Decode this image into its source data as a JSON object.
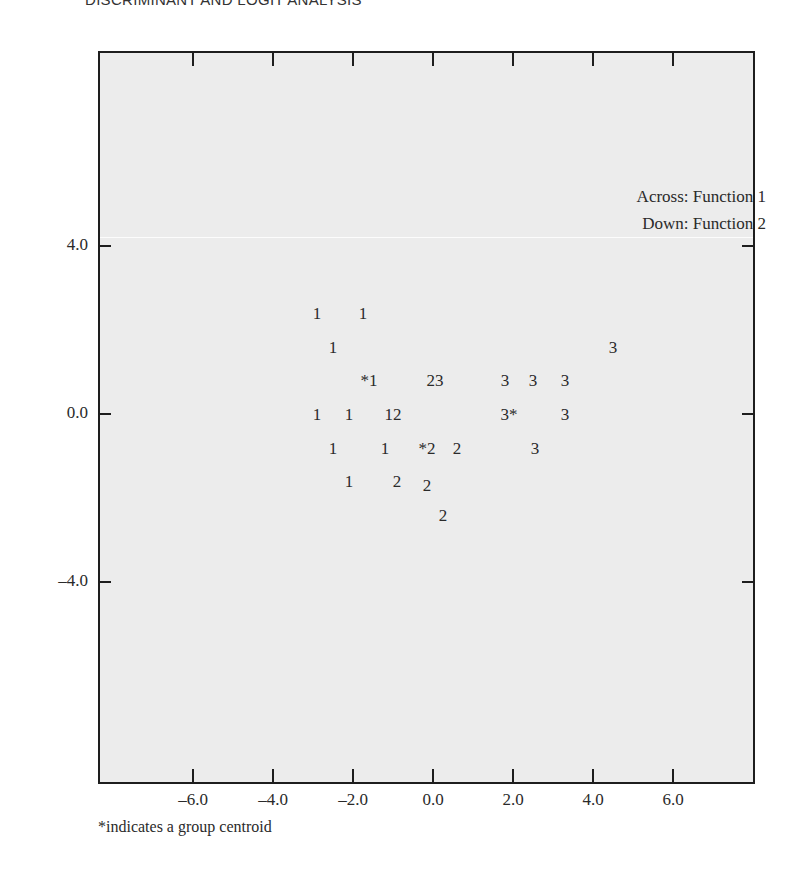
{
  "page": {
    "header": "DISCRIMINANT AND LOGIT ANALYSIS",
    "footnote": "*indicates a group centroid"
  },
  "chart_data": {
    "type": "scatter",
    "title": "",
    "legend": [
      "Across: Function 1",
      "Down: Function 2"
    ],
    "xlabel": "Function 1",
    "ylabel": "Function 2",
    "x_ticks": [
      "-6.0",
      "-4.0",
      "-2.0",
      "0.0",
      "2.0",
      "4.0",
      "6.0"
    ],
    "y_ticks": [
      "4.0",
      "0.0",
      "-4.0"
    ],
    "xlim": [
      -8.0,
      8.0
    ],
    "ylim": [
      -8.6,
      8.8
    ],
    "grid": false,
    "annotation": "*indicates a group centroid",
    "points": [
      {
        "label": "1",
        "x": -2.9,
        "y": 2.4,
        "group": 1
      },
      {
        "label": "1",
        "x": -1.75,
        "y": 2.4,
        "group": 1
      },
      {
        "label": "1",
        "x": -2.5,
        "y": 1.6,
        "group": 1
      },
      {
        "label": "*1",
        "x": -1.6,
        "y": 0.8,
        "group": 1,
        "centroid": true
      },
      {
        "label": "23",
        "x": 0.05,
        "y": 0.8,
        "group": "2,3"
      },
      {
        "label": "1",
        "x": -2.9,
        "y": 0.0,
        "group": 1
      },
      {
        "label": "1",
        "x": -2.1,
        "y": 0.0,
        "group": 1
      },
      {
        "label": "12",
        "x": -1.0,
        "y": 0.0,
        "group": "1,2"
      },
      {
        "label": "1",
        "x": -2.5,
        "y": -0.8,
        "group": 1
      },
      {
        "label": "1",
        "x": -1.2,
        "y": -0.8,
        "group": 1
      },
      {
        "label": "*2",
        "x": -0.15,
        "y": -0.8,
        "group": 2,
        "centroid": true
      },
      {
        "label": "2",
        "x": 0.6,
        "y": -0.8,
        "group": 2
      },
      {
        "label": "1",
        "x": -2.1,
        "y": -1.6,
        "group": 1
      },
      {
        "label": "2",
        "x": -0.9,
        "y": -1.6,
        "group": 2
      },
      {
        "label": "2",
        "x": -0.15,
        "y": -1.7,
        "group": 2
      },
      {
        "label": "2",
        "x": 0.25,
        "y": -2.4,
        "group": 2
      },
      {
        "label": "3",
        "x": 4.5,
        "y": 1.6,
        "group": 3
      },
      {
        "label": "3",
        "x": 1.8,
        "y": 0.8,
        "group": 3
      },
      {
        "label": "3",
        "x": 2.5,
        "y": 0.8,
        "group": 3
      },
      {
        "label": "3",
        "x": 3.3,
        "y": 0.8,
        "group": 3
      },
      {
        "label": "3*",
        "x": 1.9,
        "y": 0.0,
        "group": 3,
        "centroid": true
      },
      {
        "label": "3",
        "x": 3.3,
        "y": 0.0,
        "group": 3
      },
      {
        "label": "3",
        "x": 2.55,
        "y": -0.8,
        "group": 3
      }
    ]
  }
}
